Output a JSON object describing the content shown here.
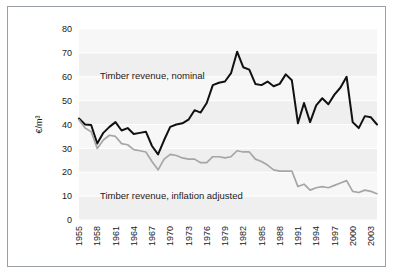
{
  "figure": {
    "y_axis_title": "€/m³",
    "border_color": "#9aa0a6",
    "plot_background": "#f2f2f2"
  },
  "chart_data": {
    "type": "line",
    "title": "",
    "xlabel": "",
    "ylabel": "€/m³",
    "ylim": [
      0,
      80
    ],
    "ytick_step": 10,
    "yticks": [
      "0",
      "10",
      "20",
      "30",
      "40",
      "50",
      "60",
      "70",
      "80"
    ],
    "xlim": [
      1955,
      2004
    ],
    "xtick_step": 3,
    "xticks": [
      "1955",
      "1958",
      "1961",
      "1964",
      "1967",
      "1970",
      "1973",
      "1976",
      "1979",
      "1982",
      "1985",
      "1988",
      "1991",
      "1994",
      "1997",
      "2000",
      "2003"
    ],
    "grid": true,
    "legend": "inline-annotations",
    "x": [
      1955,
      1956,
      1957,
      1958,
      1959,
      1960,
      1961,
      1962,
      1963,
      1964,
      1965,
      1966,
      1967,
      1968,
      1969,
      1970,
      1971,
      1972,
      1973,
      1974,
      1975,
      1976,
      1977,
      1978,
      1979,
      1980,
      1981,
      1982,
      1983,
      1984,
      1985,
      1986,
      1987,
      1988,
      1989,
      1990,
      1991,
      1992,
      1993,
      1994,
      1995,
      1996,
      1997,
      1998,
      1999,
      2000,
      2001,
      2002,
      2003,
      2004
    ],
    "series": [
      {
        "name": "Timber revenue, nominal",
        "color": "#111111",
        "label_text": "Timber revenue, nominal",
        "values": [
          42.5,
          40.0,
          39.8,
          32.0,
          36.5,
          39.0,
          41.0,
          37.5,
          38.5,
          36.0,
          36.5,
          37.0,
          31.0,
          27.5,
          33.5,
          39.0,
          40.0,
          40.5,
          42.0,
          46.0,
          45.0,
          49.0,
          56.5,
          57.5,
          58.0,
          61.5,
          70.5,
          64.0,
          63.0,
          57.0,
          56.5,
          58.0,
          56.0,
          57.0,
          61.0,
          58.5,
          40.5,
          49.0,
          41.0,
          48.0,
          51.0,
          48.5,
          52.5,
          55.5,
          60.0,
          41.0,
          38.5,
          43.5,
          43.0,
          40.0
        ]
      },
      {
        "name": "Timber revenue, inflation adjusted",
        "color": "#a6a6a6",
        "label_text": "Timber revenue, inflation adjusted",
        "values": [
          42.0,
          38.5,
          37.0,
          30.0,
          33.5,
          35.5,
          35.0,
          32.0,
          31.5,
          29.5,
          29.0,
          28.5,
          24.5,
          21.0,
          25.5,
          27.5,
          27.0,
          26.0,
          25.5,
          25.5,
          24.0,
          24.0,
          26.5,
          26.5,
          26.0,
          26.5,
          29.0,
          28.5,
          28.5,
          25.5,
          24.5,
          23.0,
          21.0,
          20.5,
          20.5,
          20.5,
          14.0,
          15.0,
          12.5,
          13.5,
          14.0,
          13.5,
          14.5,
          15.5,
          16.5,
          12.0,
          11.5,
          12.5,
          12.0,
          11.0
        ]
      }
    ]
  }
}
